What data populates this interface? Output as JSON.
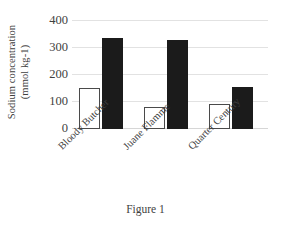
{
  "chart_data": {
    "type": "bar",
    "title": "",
    "subtitle": "",
    "caption": "Figure 1",
    "xlabel": "",
    "ylabel_line1": "Sodium concentration",
    "ylabel_line2": "(mmol kg-1)",
    "categories": [
      "Bloody Butcher",
      "Juane Flamme",
      "Quarter Century"
    ],
    "series": [
      {
        "name": "open-bar",
        "fill": "#ffffff",
        "border": "#4a4a4a",
        "values": [
          152,
          80,
          90
        ]
      },
      {
        "name": "filled-bar",
        "fill": "#1b1b1b",
        "border": "#1b1b1b",
        "values": [
          335,
          325,
          153
        ]
      }
    ],
    "ylim": [
      0,
      400
    ],
    "yticks": [
      400,
      300,
      200,
      100,
      0
    ],
    "ytick_labels": [
      "400",
      "300",
      "200",
      "100",
      "0"
    ],
    "grid": true,
    "grid_color": "#e2e2e2",
    "legend": "none",
    "legend_position": "none"
  },
  "figure": {
    "caption": "Figure 1"
  },
  "axes": {
    "y_title_line1": "Sodium concentration",
    "y_title_line2": "(mmol kg-1)"
  }
}
